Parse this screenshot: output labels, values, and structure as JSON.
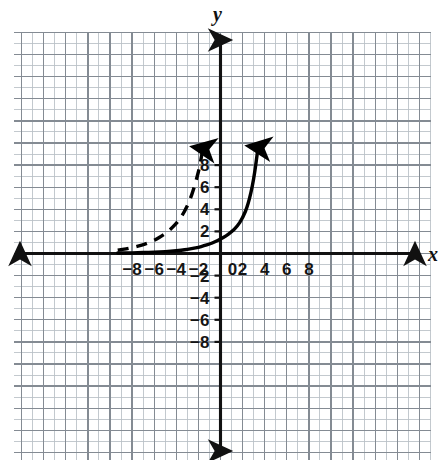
{
  "figure": {
    "title": "",
    "background_color": "#ffffff",
    "grid_color": "#9aa0a6",
    "axis_color": "#111111",
    "curve_color": "#000000"
  },
  "axes": {
    "x_label": "x",
    "y_label": "y",
    "origin_label": "0",
    "x_ticks": [
      "−8",
      "−6",
      "−4",
      "−2",
      "2",
      "4",
      "6",
      "8"
    ],
    "y_ticks": [
      "8",
      "6",
      "4",
      "2",
      "−2",
      "−4",
      "−6",
      "−8"
    ]
  },
  "chart_data": {
    "type": "line",
    "title": "",
    "xlabel": "x",
    "ylabel": "y",
    "xlim": [
      -9.4,
      9.5
    ],
    "ylim": [
      -9.1,
      10.0
    ],
    "grid": true,
    "minor_grid_step": 1,
    "major_grid_step": 2,
    "legend": "none",
    "x_ticks": [
      -8,
      -6,
      -4,
      -2,
      0,
      2,
      4,
      6,
      8
    ],
    "y_ticks": [
      -8,
      -6,
      -4,
      -2,
      2,
      4,
      6,
      8
    ],
    "series": [
      {
        "name": "solid-exponential-curve",
        "style": "solid",
        "arrow_start": false,
        "arrow_end": true,
        "description": "increasing exponential, y-intercept near 1.3, rises off the top of the grid near x = 3.4",
        "x": [
          -9.3,
          -8.5,
          -7.5,
          -6.5,
          -5.5,
          -4.5,
          -3.5,
          -3.0,
          -2.5,
          -2.0,
          -1.5,
          -1.0,
          -0.5,
          0.0,
          0.5,
          1.0,
          1.5,
          2.0,
          2.5,
          3.0,
          3.4
        ],
        "y": [
          0.04,
          0.05,
          0.07,
          0.1,
          0.14,
          0.2,
          0.3,
          0.37,
          0.46,
          0.56,
          0.69,
          0.85,
          1.05,
          1.3,
          1.6,
          1.97,
          2.43,
          3.2,
          4.4,
          6.6,
          9.6
        ]
      },
      {
        "name": "dashed-exponential-curve",
        "style": "dashed",
        "arrow_start": false,
        "arrow_end": true,
        "description": "same exponential shape translated left about 5 units, rises off the top of the grid near x = -1.6",
        "x": [
          -9.3,
          -8.8,
          -8.3,
          -7.8,
          -7.3,
          -6.8,
          -6.3,
          -5.8,
          -5.3,
          -4.8,
          -4.3,
          -3.8,
          -3.3,
          -2.8,
          -2.4,
          -2.1,
          -1.9,
          -1.75,
          -1.6
        ],
        "y": [
          0.3,
          0.38,
          0.47,
          0.58,
          0.7,
          0.86,
          1.05,
          1.3,
          1.6,
          1.95,
          2.4,
          2.95,
          3.7,
          4.75,
          5.9,
          7.0,
          7.8,
          8.6,
          9.5
        ]
      }
    ]
  }
}
